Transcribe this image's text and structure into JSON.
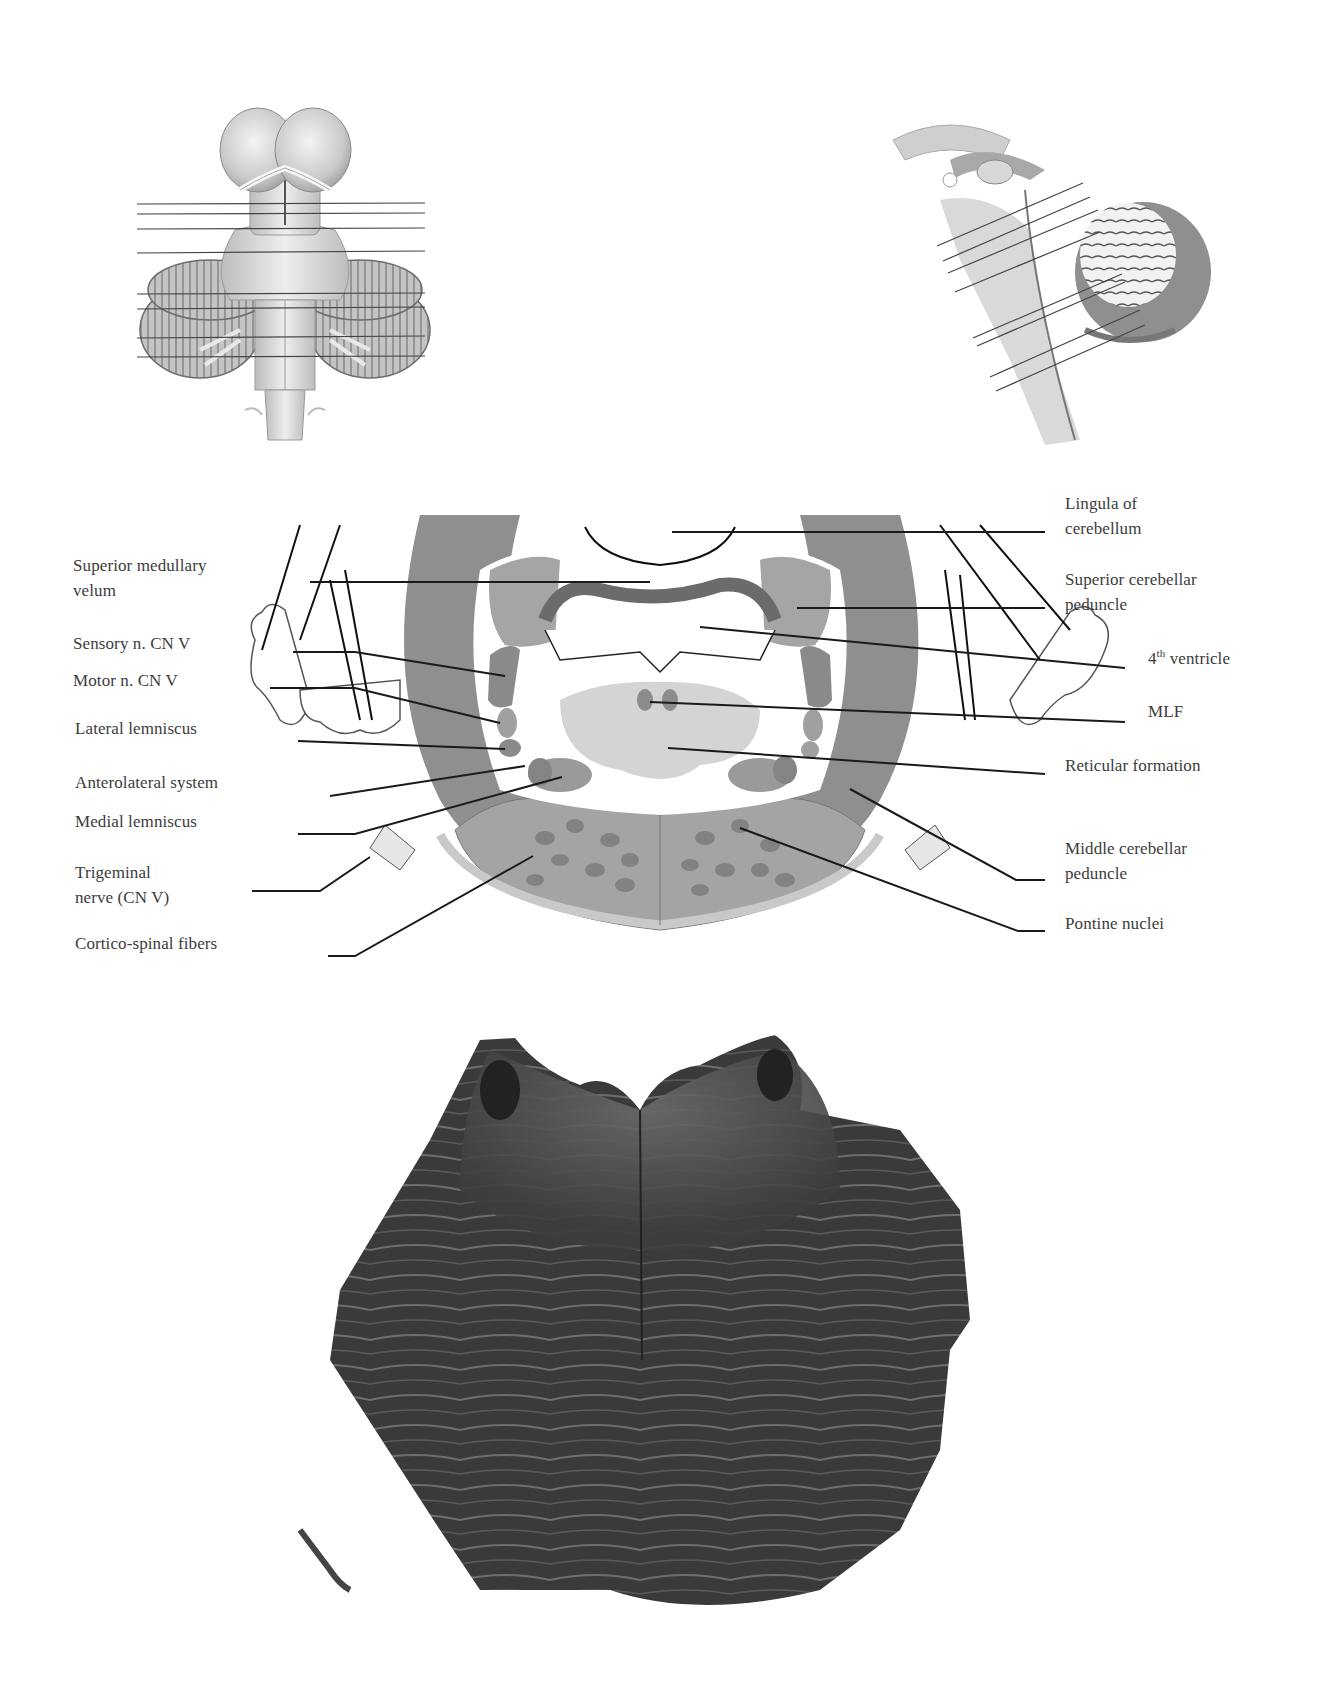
{
  "figure": {
    "type": "anatomy-diagram",
    "panels": [
      {
        "id": "ventral-brainstem-view",
        "description": "Ventral view of brainstem with cerebellum, horizontal section-level lines"
      },
      {
        "id": "sagittal-brainstem-view",
        "description": "Midsagittal view of brainstem and cerebellum with oblique section-level lines"
      },
      {
        "id": "pons-cross-section-diagram",
        "description": "Schematic cross-section of upper pons with labeled structures"
      },
      {
        "id": "pons-histology-section",
        "description": "Myelin-stained histological section of the pons"
      }
    ]
  },
  "labels_left": [
    {
      "id": "superior-medullary-velum",
      "lines": [
        "Superior medullary",
        "velum"
      ],
      "x": 73,
      "y": 570
    },
    {
      "id": "sensory-nucleus-cn-v",
      "lines": [
        "Sensory n. CN V"
      ],
      "x": 73,
      "y": 648
    },
    {
      "id": "motor-nucleus-cn-v",
      "lines": [
        "Motor n. CN V"
      ],
      "x": 73,
      "y": 685
    },
    {
      "id": "lateral-lemniscus",
      "lines": [
        "Lateral lemniscus"
      ],
      "x": 75,
      "y": 733
    },
    {
      "id": "anterolateral-system",
      "lines": [
        "Anterolateral system"
      ],
      "x": 75,
      "y": 787
    },
    {
      "id": "medial-lemniscus",
      "lines": [
        "Medial lemniscus"
      ],
      "x": 75,
      "y": 826
    },
    {
      "id": "trigeminal-nerve",
      "lines": [
        "Trigeminal",
        "nerve (CN V)"
      ],
      "x": 75,
      "y": 877
    },
    {
      "id": "cortico-spinal-fibers",
      "lines": [
        "Cortico-spinal fibers"
      ],
      "x": 75,
      "y": 948
    }
  ],
  "labels_right": [
    {
      "id": "lingula-of-cerebellum",
      "lines": [
        "Lingula of",
        "cerebellum"
      ],
      "x": 1065,
      "y": 508
    },
    {
      "id": "superior-cerebellar-peduncle",
      "lines": [
        "Superior cerebellar",
        "peduncle"
      ],
      "x": 1065,
      "y": 584
    },
    {
      "id": "fourth-ventricle",
      "lines": [
        "4",
        "th",
        " ventricle"
      ],
      "x": 1148,
      "y": 663,
      "superscript": true
    },
    {
      "id": "mlf",
      "lines": [
        "MLF"
      ],
      "x": 1148,
      "y": 716
    },
    {
      "id": "reticular-formation",
      "lines": [
        "Reticular formation"
      ],
      "x": 1065,
      "y": 770
    },
    {
      "id": "middle-cerebellar-peduncle",
      "lines": [
        "Middle cerebellar",
        "peduncle"
      ],
      "x": 1065,
      "y": 853
    },
    {
      "id": "pontine-nuclei",
      "lines": [
        "Pontine nuclei"
      ],
      "x": 1065,
      "y": 928
    }
  ],
  "leader_lines": [
    {
      "label": "superior-medullary-velum",
      "points": [
        [
          310,
          582
        ],
        [
          650,
          582
        ]
      ]
    },
    {
      "label": "sensory-nucleus-cn-v",
      "points": [
        [
          293,
          652
        ],
        [
          355,
          652
        ],
        [
          505,
          676
        ]
      ]
    },
    {
      "label": "motor-nucleus-cn-v",
      "points": [
        [
          270,
          688
        ],
        [
          355,
          688
        ],
        [
          500,
          723
        ]
      ]
    },
    {
      "label": "lateral-lemniscus",
      "points": [
        [
          298,
          741
        ],
        [
          505,
          749
        ]
      ]
    },
    {
      "label": "anterolateral-system",
      "points": [
        [
          330,
          796
        ],
        [
          525,
          766
        ]
      ]
    },
    {
      "label": "medial-lemniscus",
      "points": [
        [
          298,
          834
        ],
        [
          355,
          834
        ],
        [
          562,
          777
        ]
      ]
    },
    {
      "label": "trigeminal-nerve",
      "points": [
        [
          252,
          891
        ],
        [
          320,
          891
        ],
        [
          370,
          857
        ]
      ]
    },
    {
      "label": "cortico-spinal-fibers",
      "points": [
        [
          328,
          956
        ],
        [
          355,
          956
        ],
        [
          533,
          856
        ]
      ]
    },
    {
      "label": "lingula-of-cerebellum",
      "points": [
        [
          672,
          532
        ],
        [
          1045,
          532
        ]
      ]
    },
    {
      "label": "superior-cerebellar-peduncle",
      "points": [
        [
          797,
          608
        ],
        [
          1045,
          608
        ]
      ]
    },
    {
      "label": "fourth-ventricle",
      "points": [
        [
          700,
          627
        ],
        [
          1125,
          668
        ]
      ]
    },
    {
      "label": "mlf",
      "points": [
        [
          650,
          702
        ],
        [
          1125,
          722
        ]
      ]
    },
    {
      "label": "reticular-formation",
      "points": [
        [
          668,
          748
        ],
        [
          1045,
          774
        ]
      ]
    },
    {
      "label": "middle-cerebellar-peduncle",
      "points": [
        [
          850,
          789
        ],
        [
          1016,
          880
        ],
        [
          1045,
          880
        ]
      ]
    },
    {
      "label": "pontine-nuclei",
      "points": [
        [
          740,
          828
        ],
        [
          1018,
          931
        ],
        [
          1045,
          931
        ]
      ]
    }
  ],
  "section_lines_ventral": [
    {
      "y1": 204,
      "y2": 203
    },
    {
      "y1": 214,
      "y2": 213
    },
    {
      "y1": 229,
      "y2": 228
    },
    {
      "y1": 253,
      "y2": 251
    },
    {
      "y1": 294,
      "y2": 293
    },
    {
      "y1": 309,
      "y2": 307
    },
    {
      "y1": 338,
      "y2": 336
    },
    {
      "y1": 357,
      "y2": 356
    }
  ],
  "section_lines_sagittal": [
    {
      "x1": 937,
      "y1": 246,
      "x2": 1083,
      "y2": 183
    },
    {
      "x1": 943,
      "y1": 261,
      "x2": 1090,
      "y2": 197
    },
    {
      "x1": 948,
      "y1": 273,
      "x2": 1098,
      "y2": 210
    },
    {
      "x1": 955,
      "y1": 292,
      "x2": 1100,
      "y2": 232
    },
    {
      "x1": 973,
      "y1": 338,
      "x2": 1122,
      "y2": 274
    },
    {
      "x1": 977,
      "y1": 346,
      "x2": 1125,
      "y2": 282
    },
    {
      "x1": 990,
      "y1": 377,
      "x2": 1140,
      "y2": 310
    },
    {
      "x1": 996,
      "y1": 391,
      "x2": 1145,
      "y2": 325
    }
  ],
  "colors": {
    "background": "#ffffff",
    "text": "#3c3c3c",
    "leader_line": "#1a1a1a",
    "tract_dark": "#8a8a8a",
    "tract_mid": "#a9a9a9",
    "tract_light": "#c7c7c7",
    "reticular_light": "#d9d9d9",
    "histology_dark": "#2f2f2f",
    "histology_mid": "#555555"
  }
}
